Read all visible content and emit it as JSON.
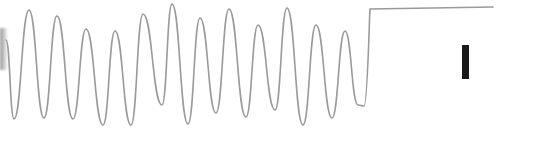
{
  "chart_data": {
    "type": "line",
    "title": "",
    "xlabel": "",
    "ylabel": "",
    "grid": false,
    "legend": null,
    "stroke_color": "#9a9a9a",
    "marker_color": "#1a1a1a",
    "points_px": [
      [
        6,
        40
      ],
      [
        14,
        119
      ],
      [
        29,
        10
      ],
      [
        44,
        118
      ],
      [
        57,
        16
      ],
      [
        73,
        119
      ],
      [
        86,
        29
      ],
      [
        103,
        125
      ],
      [
        115,
        31
      ],
      [
        131,
        125
      ],
      [
        143,
        14
      ],
      [
        162,
        105
      ],
      [
        172,
        4
      ],
      [
        188,
        124
      ],
      [
        200,
        18
      ],
      [
        216,
        113
      ],
      [
        229,
        9
      ],
      [
        246,
        117
      ],
      [
        258,
        25
      ],
      [
        275,
        110
      ],
      [
        287,
        8
      ],
      [
        303,
        125
      ],
      [
        316,
        25
      ],
      [
        332,
        118
      ],
      [
        345,
        31
      ],
      [
        358,
        105
      ],
      [
        364,
        106
      ],
      [
        370,
        9
      ],
      [
        493,
        7
      ]
    ],
    "plateau": {
      "x_start": 370,
      "x_end": 493,
      "y": 8
    },
    "marker_bar": {
      "x": 462,
      "y": 45,
      "width": 7,
      "height": 34
    }
  }
}
